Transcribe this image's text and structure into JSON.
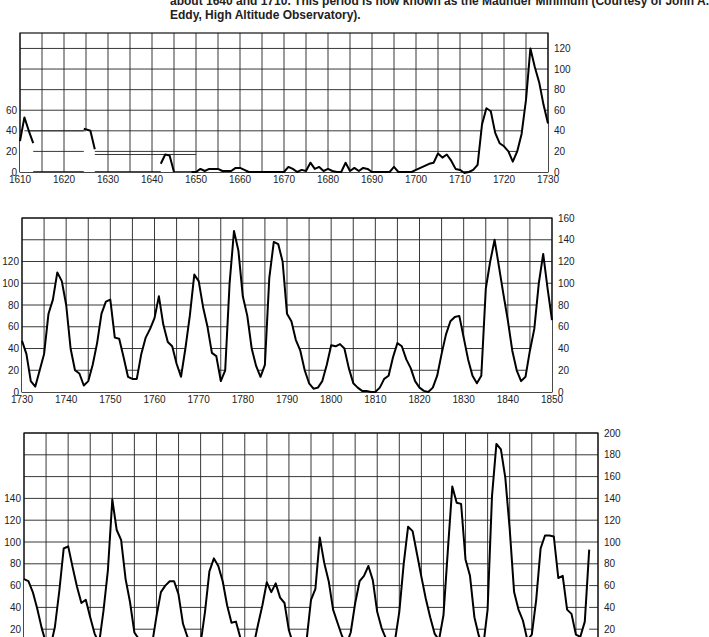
{
  "caption": {
    "line1": "about 1640 and 1710. This period is now known as the Maunder Minimum (Courtesy of John A.",
    "line2": "Eddy, High Altitude Observatory)."
  },
  "chart_data": [
    {
      "type": "line",
      "title": "Sunspot number 1610-1730",
      "xlabel": "",
      "ylabel": "",
      "xlim": [
        1610,
        1730
      ],
      "ylim": [
        0,
        135
      ],
      "x_ticks": [
        1610,
        1620,
        1630,
        1640,
        1650,
        1660,
        1670,
        1680,
        1690,
        1700,
        1710,
        1720,
        1730
      ],
      "left_y_ticks": [
        0,
        20,
        40,
        60
      ],
      "right_y_ticks": [
        0,
        20,
        40,
        60,
        80,
        100,
        120
      ],
      "grid": true,
      "segments": [
        [
          [
            1610,
            30
          ],
          [
            1611,
            53
          ],
          [
            1612,
            40
          ],
          [
            1613,
            28
          ]
        ],
        [
          [
            1624.5,
            42
          ],
          [
            1626,
            40
          ],
          [
            1627,
            22
          ]
        ],
        [
          [
            1642,
            8
          ],
          [
            1643,
            17
          ],
          [
            1644,
            16
          ],
          [
            1645,
            0
          ]
        ],
        [
          [
            1649,
            0
          ],
          [
            1650,
            0
          ],
          [
            1651,
            3
          ],
          [
            1652,
            1
          ],
          [
            1653,
            3
          ],
          [
            1654,
            3
          ],
          [
            1655,
            3
          ],
          [
            1656,
            1
          ],
          [
            1657,
            1
          ],
          [
            1658,
            1
          ],
          [
            1659,
            4
          ],
          [
            1660,
            4
          ],
          [
            1661,
            2
          ],
          [
            1662,
            0
          ],
          [
            1665,
            0
          ],
          [
            1670,
            0
          ],
          [
            1671,
            5
          ],
          [
            1672,
            3
          ],
          [
            1673,
            0
          ],
          [
            1674,
            2
          ],
          [
            1675,
            1
          ],
          [
            1676,
            9
          ],
          [
            1677,
            3
          ],
          [
            1678,
            5
          ],
          [
            1679,
            1
          ],
          [
            1680,
            3
          ],
          [
            1681,
            1
          ],
          [
            1682,
            0
          ],
          [
            1683,
            0
          ],
          [
            1684,
            9
          ],
          [
            1685,
            1
          ],
          [
            1686,
            4
          ],
          [
            1687,
            1
          ],
          [
            1688,
            4
          ],
          [
            1689,
            3
          ],
          [
            1690,
            0
          ],
          [
            1694,
            0
          ],
          [
            1695,
            5
          ],
          [
            1696,
            0
          ],
          [
            1699,
            0
          ],
          [
            1700,
            2
          ],
          [
            1701,
            4
          ],
          [
            1702,
            6
          ],
          [
            1703,
            8
          ],
          [
            1704,
            9
          ],
          [
            1705,
            18
          ],
          [
            1706,
            14
          ],
          [
            1707,
            17
          ],
          [
            1708,
            11
          ],
          [
            1709,
            3
          ],
          [
            1710,
            2
          ],
          [
            1711,
            -1
          ],
          [
            1712,
            0
          ],
          [
            1713,
            2
          ],
          [
            1714,
            7
          ],
          [
            1715,
            46
          ],
          [
            1716,
            62
          ],
          [
            1717,
            59
          ],
          [
            1718,
            38
          ],
          [
            1719,
            28
          ],
          [
            1720,
            25
          ],
          [
            1721,
            20
          ],
          [
            1722,
            10
          ],
          [
            1723,
            20
          ],
          [
            1724,
            37
          ],
          [
            1725,
            70
          ],
          [
            1726,
            120
          ],
          [
            1727,
            102
          ],
          [
            1728,
            87
          ],
          [
            1729,
            65
          ],
          [
            1730,
            47
          ]
        ]
      ],
      "flat_guides": [
        [
          1611,
          40,
          1625,
          40
        ],
        [
          1627,
          17,
          1650,
          17
        ]
      ]
    },
    {
      "type": "line",
      "title": "Sunspot number 1730-1850",
      "xlim": [
        1730,
        1850
      ],
      "ylim": [
        0,
        160
      ],
      "x_ticks": [
        1730,
        1740,
        1750,
        1760,
        1770,
        1780,
        1790,
        1800,
        1810,
        1820,
        1830,
        1840,
        1850
      ],
      "left_y_ticks": [
        0,
        20,
        40,
        60,
        80,
        100,
        120
      ],
      "right_y_ticks": [
        0,
        20,
        40,
        60,
        80,
        100,
        120,
        140,
        160
      ],
      "grid": true,
      "x": [
        1730,
        1731,
        1732,
        1733,
        1734,
        1735,
        1736,
        1737,
        1738,
        1739,
        1740,
        1741,
        1742,
        1743,
        1744,
        1745,
        1746,
        1747,
        1748,
        1749,
        1750,
        1751,
        1752,
        1753,
        1754,
        1755,
        1756,
        1757,
        1758,
        1759,
        1760,
        1761,
        1762,
        1763,
        1764,
        1765,
        1766,
        1767,
        1768,
        1769,
        1770,
        1771,
        1772,
        1773,
        1774,
        1775,
        1776,
        1777,
        1778,
        1779,
        1780,
        1781,
        1782,
        1783,
        1784,
        1785,
        1786,
        1787,
        1788,
        1789,
        1790,
        1791,
        1792,
        1793,
        1794,
        1795,
        1796,
        1797,
        1798,
        1799,
        1800,
        1801,
        1802,
        1803,
        1804,
        1805,
        1806,
        1807,
        1808,
        1809,
        1810,
        1811,
        1812,
        1813,
        1814,
        1815,
        1816,
        1817,
        1818,
        1819,
        1820,
        1821,
        1822,
        1823,
        1824,
        1825,
        1826,
        1827,
        1828,
        1829,
        1830,
        1831,
        1832,
        1833,
        1834,
        1835,
        1836,
        1837,
        1838,
        1839,
        1840,
        1841,
        1842,
        1843,
        1844,
        1845,
        1846,
        1847,
        1848,
        1849,
        1850
      ],
      "values": [
        47,
        35,
        10,
        5,
        20,
        35,
        72,
        85,
        110,
        102,
        80,
        40,
        20,
        17,
        6,
        10,
        25,
        45,
        72,
        83,
        85,
        50,
        49,
        32,
        14,
        12,
        12,
        35,
        50,
        58,
        68,
        88,
        62,
        46,
        42,
        26,
        14,
        40,
        70,
        108,
        102,
        78,
        60,
        36,
        33,
        10,
        20,
        100,
        148,
        130,
        88,
        70,
        40,
        24,
        14,
        25,
        105,
        138,
        136,
        120,
        72,
        65,
        48,
        38,
        20,
        8,
        3,
        4,
        10,
        25,
        43,
        42,
        44,
        40,
        22,
        8,
        4,
        1,
        1,
        0,
        0,
        4,
        12,
        15,
        32,
        45,
        42,
        30,
        22,
        10,
        4,
        1,
        0,
        4,
        15,
        35,
        53,
        65,
        69,
        70,
        50,
        30,
        15,
        8,
        15,
        95,
        120,
        140,
        115,
        90,
        66,
        38,
        20,
        10,
        14,
        38,
        58,
        100,
        127,
        95,
        66
      ]
    },
    {
      "type": "line",
      "title": "Sunspot number 1850-1975",
      "xlim": [
        1850,
        1980
      ],
      "ylim": [
        0,
        200
      ],
      "x_ticks": [],
      "left_y_ticks": [
        20,
        40,
        60,
        80,
        100,
        120,
        140
      ],
      "right_y_ticks": [
        0,
        20,
        40,
        60,
        80,
        100,
        120,
        140,
        160,
        180,
        200
      ],
      "grid": true,
      "x": [
        1850,
        1851,
        1852,
        1853,
        1854,
        1855,
        1856,
        1857,
        1858,
        1859,
        1860,
        1861,
        1862,
        1863,
        1864,
        1865,
        1866,
        1867,
        1868,
        1869,
        1870,
        1871,
        1872,
        1873,
        1874,
        1875,
        1876,
        1877,
        1878,
        1879,
        1880,
        1881,
        1882,
        1883,
        1884,
        1885,
        1886,
        1887,
        1888,
        1889,
        1890,
        1891,
        1892,
        1893,
        1894,
        1895,
        1896,
        1897,
        1898,
        1899,
        1900,
        1901,
        1902,
        1903,
        1904,
        1905,
        1906,
        1907,
        1908,
        1909,
        1910,
        1911,
        1912,
        1913,
        1914,
        1915,
        1916,
        1917,
        1918,
        1919,
        1920,
        1921,
        1922,
        1923,
        1924,
        1925,
        1926,
        1927,
        1928,
        1929,
        1930,
        1931,
        1932,
        1933,
        1934,
        1935,
        1936,
        1937,
        1938,
        1939,
        1940,
        1941,
        1942,
        1943,
        1944,
        1945,
        1946,
        1947,
        1948,
        1949,
        1950,
        1951,
        1952,
        1953,
        1954,
        1955,
        1956,
        1957,
        1958,
        1959,
        1960,
        1961,
        1962,
        1963,
        1964,
        1965,
        1966,
        1967,
        1968,
        1969,
        1970,
        1971,
        1972,
        1973,
        1974,
        1975,
        1976,
        1977,
        1978
      ],
      "values": [
        66,
        64,
        54,
        39,
        21,
        7,
        4,
        22,
        55,
        94,
        96,
        77,
        59,
        44,
        47,
        31,
        16,
        7,
        37,
        74,
        139,
        111,
        102,
        66,
        45,
        17,
        11,
        12,
        3,
        6,
        32,
        54,
        60,
        64,
        64,
        52,
        25,
        13,
        7,
        6,
        7,
        36,
        73,
        85,
        78,
        64,
        42,
        26,
        27,
        12,
        10,
        3,
        5,
        24,
        42,
        63,
        54,
        62,
        49,
        44,
        19,
        6,
        4,
        1,
        10,
        47,
        57,
        104,
        81,
        64,
        38,
        26,
        14,
        6,
        17,
        44,
        64,
        69,
        78,
        65,
        36,
        21,
        11,
        6,
        9,
        36,
        80,
        114,
        110,
        89,
        68,
        48,
        31,
        16,
        10,
        33,
        93,
        151,
        136,
        135,
        84,
        69,
        31,
        14,
        4,
        38,
        142,
        190,
        185,
        159,
        112,
        54,
        38,
        28,
        10,
        15,
        47,
        94,
        106,
        106,
        105,
        67,
        69,
        38,
        34,
        15,
        13,
        27,
        93,
        155
      ]
    }
  ]
}
